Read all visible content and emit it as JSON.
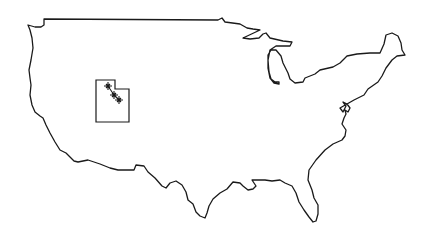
{
  "map": {
    "subject": "Continental United States outline",
    "highlighted_region": "Utah",
    "stroke_color": "#1a1a1a",
    "background_color": "#ffffff",
    "markers": [
      {
        "x": 108,
        "y": 86
      },
      {
        "x": 114,
        "y": 95
      },
      {
        "x": 119,
        "y": 100
      }
    ]
  }
}
